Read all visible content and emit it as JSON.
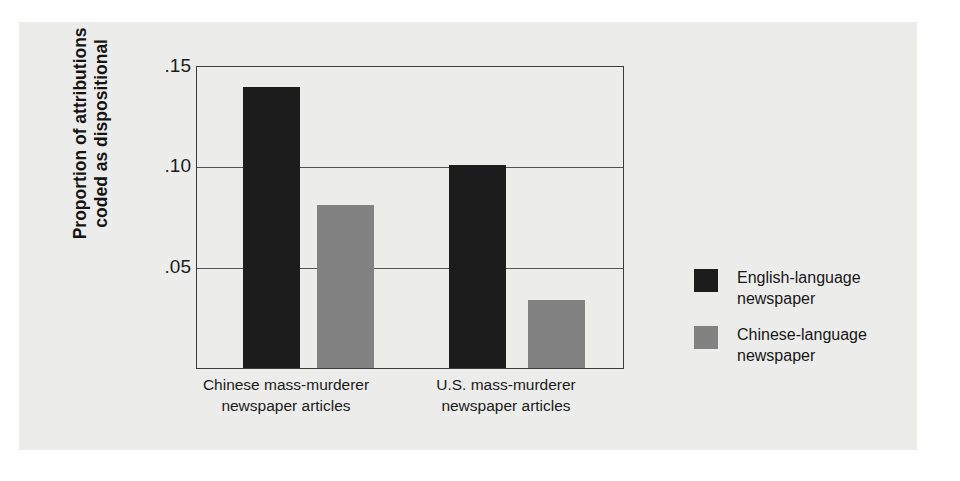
{
  "figure": {
    "background_color": "#ececeb",
    "page_background_color": "#ffffff"
  },
  "chart_data": {
    "type": "bar",
    "title": "",
    "xlabel": "",
    "ylabel": "Proportion of attributions coded as dispositional",
    "ylabel_lines": [
      "Proportion of attributions",
      "coded as dispositional"
    ],
    "categories": [
      "Chinese mass-murderer newspaper articles",
      "U.S. mass-murderer newspaper articles"
    ],
    "category_lines": [
      [
        "Chinese mass-murderer",
        "newspaper articles"
      ],
      [
        "U.S. mass-murderer",
        "newspaper articles"
      ]
    ],
    "series": [
      {
        "name": "English-language newspaper",
        "name_lines": [
          "English-language",
          "newspaper"
        ],
        "color": "#1c1c1c",
        "values": [
          0.14,
          0.101
        ]
      },
      {
        "name": "Chinese-language newspaper",
        "name_lines": [
          "Chinese-language",
          "newspaper"
        ],
        "color": "#828282",
        "values": [
          0.081,
          0.034
        ]
      }
    ],
    "ylim": [
      0,
      0.15
    ],
    "yticks": [
      0.05,
      0.1,
      0.15
    ],
    "ytick_labels": [
      ".05",
      ".10",
      ".15"
    ],
    "grid": true,
    "gridlines_at": [
      0.05,
      0.1
    ],
    "legend_position": "right"
  },
  "axis": {
    "tick_0": ".15",
    "tick_1": ".10",
    "tick_2": ".05",
    "title_line_1": "Proportion of attributions",
    "title_line_2": "coded as dispositional"
  },
  "categories": {
    "cat_0_line_1": "Chinese mass-murderer",
    "cat_0_line_2": "newspaper articles",
    "cat_1_line_1": "U.S. mass-murderer",
    "cat_1_line_2": "newspaper articles"
  },
  "legend": {
    "entry_0_label": "English-language\nnewspaper",
    "entry_1_label": "Chinese-language\nnewspaper"
  },
  "page_bleed": {
    "lines": [
      "a thousand words in a single glance are there, at the same time, to be",
      "the interpretation to be made about the cause of events. In the",
      "their own actions, but the situation and its pressures are more",
      "observers attribute the behavior to the person's disposition.",
      "and colleagues (1994) examined news reports of two",
      "murders that occurred in the United States. One was",
      "student; the other was committed by an American",
      "the coverage appeared in both English-language",
      "papers. The researchers coded every explanatory",
      "the story and classified it as dispositional or",
      "finding: English-language reporters made more",
      "explanations than Chinese-language reporters,",
      "in each case (see Figure). Such results",
      "that cultural frames shape the attributions"
    ]
  }
}
